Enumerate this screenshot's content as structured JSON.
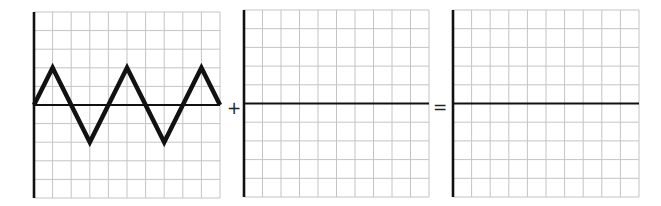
{
  "diagram": {
    "grid": {
      "columns": 10,
      "rows": 10,
      "axis_row_from_top": 5
    },
    "colors": {
      "grid_line": "#c4c4c4",
      "axis": "#111111",
      "wave": "#111111",
      "background": "#ffffff"
    },
    "operators": {
      "plus": "+",
      "equals": "="
    },
    "panels": [
      {
        "id": "wave-a",
        "label": "Wave A (triangle wave)",
        "wave_points": [
          [
            0,
            0
          ],
          [
            1,
            2
          ],
          [
            3,
            -2
          ],
          [
            5,
            2
          ],
          [
            7,
            -2
          ],
          [
            9,
            2
          ],
          [
            10,
            0
          ]
        ],
        "units": "grid cells (x: column, y: cells above axis)"
      },
      {
        "id": "wave-b",
        "label": "Wave B (blank to complete)",
        "wave_points": []
      },
      {
        "id": "result",
        "label": "Resulting wave (blank to complete)",
        "wave_points": []
      }
    ]
  }
}
